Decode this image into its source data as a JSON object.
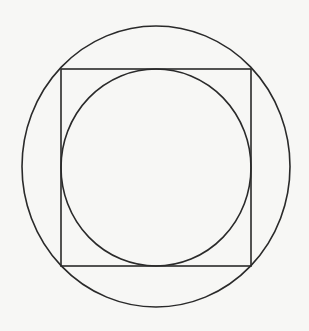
{
  "canvas": {
    "width": 309,
    "height": 331,
    "background": "#f7f7f5"
  },
  "diagram": {
    "type": "geometry",
    "stroke_color": "#2a2a2a",
    "stroke_width": 1.6,
    "shapes": [
      {
        "name": "outer-circle",
        "kind": "ellipse",
        "cx": 156,
        "cy": 166.5,
        "rx": 134,
        "ry": 140.5
      },
      {
        "name": "square",
        "kind": "rect",
        "x": 61,
        "y": 69,
        "width": 190,
        "height": 197
      },
      {
        "name": "inner-circle",
        "kind": "ellipse",
        "cx": 156,
        "cy": 167.5,
        "rx": 95,
        "ry": 98.5
      }
    ]
  }
}
